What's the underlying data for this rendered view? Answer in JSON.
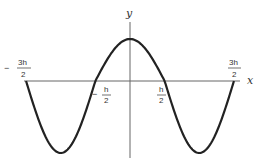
{
  "diagram": {
    "title": "",
    "function_desc": "cos(pi x / h) style wave",
    "axes": {
      "x_label": "x",
      "y_label": "y"
    },
    "ticks": [
      {
        "id": "neg3h2",
        "sign": "−",
        "num": "3h",
        "den": "2",
        "value": -1.5
      },
      {
        "id": "negh2",
        "sign": "−",
        "num": "h",
        "den": "2",
        "value": -0.5
      },
      {
        "id": "h2",
        "sign": "",
        "num": "h",
        "den": "2",
        "value": 0.5
      },
      {
        "id": "3h2",
        "sign": "",
        "num": "3h",
        "den": "2",
        "value": 1.5
      }
    ],
    "colors": {
      "curve": "#222222",
      "axis": "#666666",
      "text": "#333333"
    }
  },
  "chart_data": {
    "type": "line",
    "title": "",
    "xlabel": "x",
    "ylabel": "y",
    "x_unit": "h",
    "x": [
      -1.5,
      -1.25,
      -1.0,
      -0.75,
      -0.5,
      -0.25,
      0,
      0.25,
      0.5,
      0.75,
      1.0,
      1.25,
      1.5
    ],
    "series": [
      {
        "name": "y = cos(pi x / h)",
        "values": [
          0,
          -0.707,
          -1,
          -0.707,
          0,
          0.707,
          1,
          0.707,
          0,
          -0.707,
          -1,
          -0.707,
          0
        ]
      }
    ],
    "x_tick_labels": [
      "-3h/2",
      "-h/2",
      "h/2",
      "3h/2"
    ],
    "grid": false,
    "legend": "none"
  }
}
